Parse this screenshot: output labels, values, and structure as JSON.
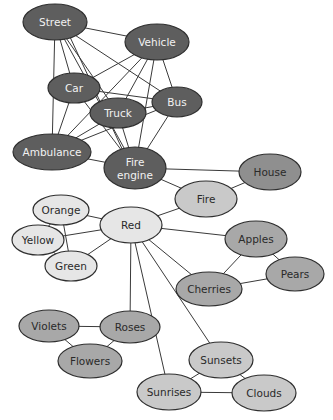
{
  "diagram": {
    "type": "semantic-network",
    "nodes": [
      {
        "id": "street",
        "label": "Street",
        "x": 55,
        "y": 22,
        "rx": 32,
        "ry": 18,
        "tone": "dark"
      },
      {
        "id": "vehicle",
        "label": "Vehicle",
        "x": 157,
        "y": 42,
        "rx": 32,
        "ry": 18,
        "tone": "dark"
      },
      {
        "id": "car",
        "label": "Car",
        "x": 74,
        "y": 88,
        "rx": 26,
        "ry": 15,
        "tone": "dark"
      },
      {
        "id": "truck",
        "label": "Truck",
        "x": 118,
        "y": 113,
        "rx": 28,
        "ry": 15,
        "tone": "dark"
      },
      {
        "id": "bus",
        "label": "Bus",
        "x": 177,
        "y": 102,
        "rx": 25,
        "ry": 15,
        "tone": "dark"
      },
      {
        "id": "ambulance",
        "label": "Ambulance",
        "x": 52,
        "y": 152,
        "rx": 39,
        "ry": 18,
        "tone": "dark"
      },
      {
        "id": "fire_engine",
        "label": "Fire engine",
        "label_lines": [
          "Fire",
          "engine"
        ],
        "x": 135,
        "y": 168,
        "rx": 31,
        "ry": 21,
        "tone": "dark"
      },
      {
        "id": "house",
        "label": "House",
        "x": 270,
        "y": 172,
        "rx": 31,
        "ry": 18,
        "tone": "house"
      },
      {
        "id": "fire",
        "label": "Fire",
        "x": 206,
        "y": 199,
        "rx": 31,
        "ry": 18,
        "tone": "light"
      },
      {
        "id": "orange",
        "label": "Orange",
        "x": 61,
        "y": 210,
        "rx": 28,
        "ry": 15,
        "tone": "lightest"
      },
      {
        "id": "red",
        "label": "Red",
        "x": 131,
        "y": 225,
        "rx": 31,
        "ry": 18,
        "tone": "lightest"
      },
      {
        "id": "yellow",
        "label": "Yellow",
        "x": 38,
        "y": 240,
        "rx": 26,
        "ry": 15,
        "tone": "lightest"
      },
      {
        "id": "green",
        "label": "Green",
        "x": 71,
        "y": 266,
        "rx": 26,
        "ry": 15,
        "tone": "lightest"
      },
      {
        "id": "apples",
        "label": "Apples",
        "x": 256,
        "y": 239,
        "rx": 31,
        "ry": 18,
        "tone": "mid"
      },
      {
        "id": "pears",
        "label": "Pears",
        "x": 295,
        "y": 274,
        "rx": 29,
        "ry": 17,
        "tone": "mid"
      },
      {
        "id": "cherries",
        "label": "Cherries",
        "x": 209,
        "y": 289,
        "rx": 33,
        "ry": 17,
        "tone": "mid"
      },
      {
        "id": "violets",
        "label": "Violets",
        "x": 49,
        "y": 326,
        "rx": 30,
        "ry": 16,
        "tone": "mid"
      },
      {
        "id": "roses",
        "label": "Roses",
        "x": 130,
        "y": 327,
        "rx": 30,
        "ry": 16,
        "tone": "mid"
      },
      {
        "id": "flowers",
        "label": "Flowers",
        "x": 90,
        "y": 361,
        "rx": 32,
        "ry": 17,
        "tone": "mid"
      },
      {
        "id": "sunsets",
        "label": "Sunsets",
        "x": 221,
        "y": 360,
        "rx": 32,
        "ry": 18,
        "tone": "light"
      },
      {
        "id": "sunrises",
        "label": "Sunrises",
        "x": 169,
        "y": 392,
        "rx": 32,
        "ry": 18,
        "tone": "light"
      },
      {
        "id": "clouds",
        "label": "Clouds",
        "x": 264,
        "y": 393,
        "rx": 32,
        "ry": 18,
        "tone": "light"
      }
    ],
    "edges": [
      [
        "street",
        "vehicle"
      ],
      [
        "street",
        "car"
      ],
      [
        "street",
        "truck"
      ],
      [
        "street",
        "bus"
      ],
      [
        "street",
        "ambulance"
      ],
      [
        "street",
        "fire_engine"
      ],
      [
        "street",
        "fire_engine"
      ],
      [
        "vehicle",
        "car"
      ],
      [
        "vehicle",
        "truck"
      ],
      [
        "vehicle",
        "bus"
      ],
      [
        "vehicle",
        "ambulance"
      ],
      [
        "vehicle",
        "fire_engine"
      ],
      [
        "car",
        "bus"
      ],
      [
        "car",
        "ambulance"
      ],
      [
        "car",
        "fire_engine"
      ],
      [
        "truck",
        "bus"
      ],
      [
        "truck",
        "ambulance"
      ],
      [
        "truck",
        "fire_engine"
      ],
      [
        "bus",
        "ambulance"
      ],
      [
        "bus",
        "fire_engine"
      ],
      [
        "ambulance",
        "fire_engine"
      ],
      [
        "fire_engine",
        "house"
      ],
      [
        "fire_engine",
        "fire"
      ],
      [
        "fire",
        "house"
      ],
      [
        "fire",
        "red"
      ],
      [
        "red",
        "orange"
      ],
      [
        "red",
        "yellow"
      ],
      [
        "red",
        "green"
      ],
      [
        "orange",
        "yellow"
      ],
      [
        "orange",
        "green"
      ],
      [
        "yellow",
        "green"
      ],
      [
        "red",
        "apples"
      ],
      [
        "red",
        "cherries"
      ],
      [
        "red",
        "roses"
      ],
      [
        "red",
        "sunrises"
      ],
      [
        "red",
        "sunsets"
      ],
      [
        "apples",
        "pears"
      ],
      [
        "apples",
        "cherries"
      ],
      [
        "cherries",
        "pears"
      ],
      [
        "violets",
        "roses"
      ],
      [
        "violets",
        "flowers"
      ],
      [
        "roses",
        "flowers"
      ],
      [
        "sunsets",
        "sunrises"
      ],
      [
        "sunsets",
        "clouds"
      ],
      [
        "sunrises",
        "clouds"
      ]
    ]
  }
}
